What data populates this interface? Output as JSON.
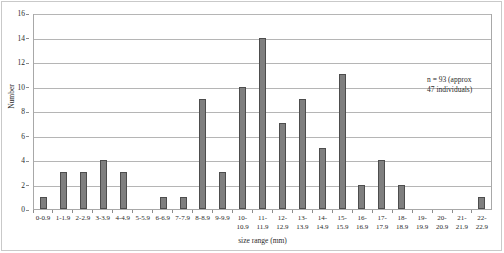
{
  "chart_data": {
    "type": "bar",
    "title": "",
    "xlabel": "size range (mm)",
    "ylabel": "Number",
    "ylim": [
      0,
      16
    ],
    "ytick_step": 2,
    "yticks": [
      0,
      2,
      4,
      6,
      8,
      10,
      12,
      14,
      16
    ],
    "grid": true,
    "legend": "none",
    "bar_color": "#7f7f7f",
    "bar_edge_color": "#4d4d4d",
    "categories": [
      "0-0.9",
      "1-1.9",
      "2-2.9",
      "3-3.9",
      "4-4.9",
      "5-5.9",
      "6-6.9",
      "7-7.9",
      "8-8.9",
      "9-9.9",
      "10-10.9",
      "11-11.9",
      "12-12.9",
      "13-13.9",
      "14-14.9",
      "15-15.9",
      "16-16.9",
      "17-17.9",
      "18-18.9",
      "19-19.9",
      "20-20.9",
      "21-21.9",
      "22-22.9"
    ],
    "category_lines": [
      [
        "0-0.9"
      ],
      [
        "1-1.9"
      ],
      [
        "2-2.9"
      ],
      [
        "3-3.9"
      ],
      [
        "4-4.9"
      ],
      [
        "5-5.9"
      ],
      [
        "6-6.9"
      ],
      [
        "7-7.9"
      ],
      [
        "8-8.9"
      ],
      [
        "9-9.9"
      ],
      [
        "10-",
        "10.9"
      ],
      [
        "11-",
        "11.9"
      ],
      [
        "12-",
        "12.9"
      ],
      [
        "13-",
        "13.9"
      ],
      [
        "14-",
        "14.9"
      ],
      [
        "15-",
        "15.9"
      ],
      [
        "16-",
        "16.9"
      ],
      [
        "17-",
        "17.9"
      ],
      [
        "18-",
        "18.9"
      ],
      [
        "19-",
        "19.9"
      ],
      [
        "20-",
        "20.9"
      ],
      [
        "21-",
        "21.9"
      ],
      [
        "22-",
        "22.9"
      ]
    ],
    "values": [
      1,
      3,
      3,
      4,
      3,
      0,
      1,
      1,
      9,
      3,
      10,
      14,
      7,
      9,
      5,
      11,
      2,
      4,
      2,
      0,
      0,
      0,
      1
    ],
    "annotation_lines": [
      "n = 93 (approx",
      "47 individuals)"
    ]
  }
}
